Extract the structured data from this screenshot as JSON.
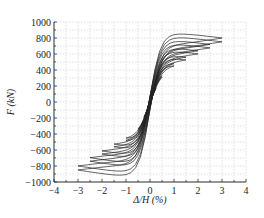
{
  "chart_data": {
    "type": "line",
    "title": "",
    "xlabel": "Δ/H (%)",
    "ylabel": "F (kN)",
    "xlim": [
      -4,
      4
    ],
    "ylim": [
      -1000,
      1000
    ],
    "x_ticks": [
      "-4",
      "-3",
      "-2",
      "-1",
      "0",
      "1",
      "2",
      "3",
      "4"
    ],
    "y_ticks": [
      "1000",
      "800",
      "600",
      "400",
      "200",
      "0",
      "-200",
      "-400",
      "-600",
      "-800",
      "-1000"
    ],
    "grid": true,
    "legend": [],
    "series": [
      {
        "name": "hysteresis",
        "cycle_peaks": [
          {
            "drift": 0.25,
            "pos": 180,
            "neg": -200
          },
          {
            "drift": 0.5,
            "pos": 330,
            "neg": -360
          },
          {
            "drift": 1.0,
            "pos": 480,
            "neg": -480
          },
          {
            "drift": 1.5,
            "pos": 560,
            "neg": -560
          },
          {
            "drift": 2.0,
            "pos": 640,
            "neg": -650
          },
          {
            "drift": 2.5,
            "pos": 720,
            "neg": -740
          },
          {
            "drift": 3.0,
            "pos": 800,
            "neg": -850
          }
        ]
      }
    ]
  }
}
